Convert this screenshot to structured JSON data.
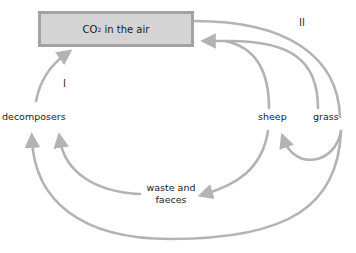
{
  "diagram": {
    "type": "carbon-cycle",
    "box": {
      "prefix": "CO",
      "subscript": "2",
      "suffix": " in the air"
    },
    "nodes": {
      "decomposers": "decomposers",
      "sheep": "sheep",
      "grass": "grass",
      "waste_line1": "waste and",
      "waste_line2": "faeces"
    },
    "cycle_labels": {
      "one": "I",
      "two": "II"
    },
    "arrows": [
      {
        "from": "decomposers",
        "to": "CO2 in the air"
      },
      {
        "from": "sheep",
        "to": "CO2 in the air"
      },
      {
        "from": "grass",
        "to": "CO2 in the air"
      },
      {
        "from": "CO2 in the air",
        "to": "grass"
      },
      {
        "from": "grass",
        "to": "sheep"
      },
      {
        "from": "sheep",
        "to": "waste and faeces"
      },
      {
        "from": "waste and faeces",
        "to": "decomposers"
      },
      {
        "from": "grass",
        "to": "decomposers"
      }
    ],
    "colors": {
      "arrow": "#b3b3b3",
      "box_fill": "#d4d4d4",
      "box_border": "#a3a3a3"
    }
  }
}
